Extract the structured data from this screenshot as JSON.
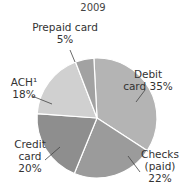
{
  "chart_data": {
    "type": "pie",
    "title": "2009",
    "start_angle_deg": -3,
    "direction": "clockwise",
    "slices": [
      {
        "name": "Debit card",
        "value": 35,
        "label_lines": [
          "Debit",
          "card 35%"
        ],
        "color": "#b4b4b4"
      },
      {
        "name": "Checks (paid)",
        "value": 22,
        "label_lines": [
          "Checks",
          "(paid)",
          "22%"
        ],
        "color": "#9b9b9b"
      },
      {
        "name": "Credit card",
        "value": 20,
        "label_lines": [
          "Credit",
          "card",
          "20%"
        ],
        "color": "#8e8e8e"
      },
      {
        "name": "ACH",
        "value": 18,
        "label_lines": [
          "ACH¹",
          "18%"
        ],
        "color": "#d0d0d0"
      },
      {
        "name": "Prepaid card",
        "value": 5,
        "label_lines": [
          "Prepaid card",
          "5%"
        ],
        "color": "#a2a2a2"
      }
    ]
  }
}
